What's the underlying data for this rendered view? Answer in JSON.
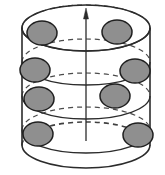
{
  "figure": {
    "title": "Cylinder with rotation axis and particle rings",
    "type": "geometric-diagram",
    "width": 165,
    "height": 175,
    "background_color": "#ffffff"
  },
  "colors": {
    "stroke": "#2b2b2b",
    "particle_fill": "#8f8f8f",
    "particle_stroke": "#1f1f1f",
    "axis": "#2b2b2b",
    "background": "#ffffff"
  },
  "cylinder": {
    "name": "cylinder",
    "left_x": 22,
    "right_x": 150,
    "center_x": 86,
    "radius_x": 64,
    "radius_y": 23,
    "top_center_y": 28,
    "bottom_center_y": 145,
    "wall_stroke_width": 1.6
  },
  "axis": {
    "name": "rotation-axis",
    "label": "",
    "x": 86,
    "top_y": 8,
    "bottom_y": 141,
    "arrow_head_width": 5,
    "arrow_head_height": 11,
    "stroke_width": 1.3,
    "direction": "up"
  },
  "rings": [
    {
      "id": "ring-1",
      "label": "top ring",
      "center_y": 28,
      "radius_x": 64,
      "radius_y": 23,
      "front_style": "solid",
      "back_style": "dashed"
    },
    {
      "id": "ring-2",
      "label": "second ring",
      "center_y": 62,
      "radius_x": 64,
      "radius_y": 23,
      "front_style": "solid",
      "back_style": "dashed"
    },
    {
      "id": "ring-3",
      "label": "third ring",
      "center_y": 96,
      "radius_x": 64,
      "radius_y": 23,
      "front_style": "solid",
      "back_style": "dashed"
    },
    {
      "id": "ring-4",
      "label": "bottom ring",
      "center_y": 130,
      "radius_x": 64,
      "radius_y": 23,
      "front_style": "solid",
      "back_style": "dashed"
    }
  ],
  "particles": [
    {
      "id": "p1",
      "ring": "ring-1",
      "side": "left",
      "cx": 42,
      "cy": 33,
      "rx": 15,
      "ry": 12
    },
    {
      "id": "p2",
      "ring": "ring-1",
      "side": "right",
      "cx": 117,
      "cy": 32,
      "rx": 15,
      "ry": 12
    },
    {
      "id": "p3",
      "ring": "ring-2",
      "side": "left",
      "cx": 35,
      "cy": 70,
      "rx": 15,
      "ry": 12
    },
    {
      "id": "p4",
      "ring": "ring-2",
      "side": "right",
      "cx": 135,
      "cy": 71,
      "rx": 15,
      "ry": 12
    },
    {
      "id": "p5",
      "ring": "ring-3",
      "side": "left",
      "cx": 39,
      "cy": 99,
      "rx": 15,
      "ry": 12
    },
    {
      "id": "p6",
      "ring": "ring-3",
      "side": "right",
      "cx": 115,
      "cy": 96,
      "rx": 15,
      "ry": 12
    },
    {
      "id": "p7",
      "ring": "ring-4",
      "side": "left",
      "cx": 38,
      "cy": 134,
      "rx": 15,
      "ry": 12
    },
    {
      "id": "p8",
      "ring": "ring-4",
      "side": "right",
      "cx": 138,
      "cy": 135,
      "rx": 15,
      "ry": 12
    }
  ],
  "dash_pattern": "5,4"
}
